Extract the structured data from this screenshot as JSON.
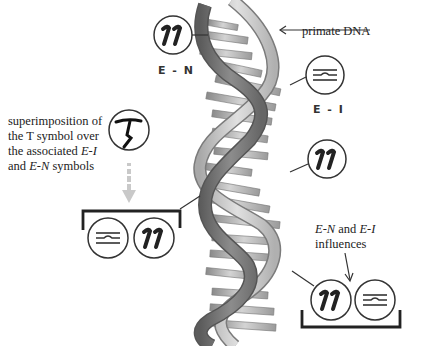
{
  "diagram": {
    "type": "annotated-illustration",
    "labels": {
      "primate_dna": "primate DNA",
      "en_label": "E - N",
      "ei_label": "E - I",
      "superimposition": {
        "line1": "superimposition of",
        "line2": "the T symbol over",
        "line3_pre": "the associated ",
        "line3_it": "E-I",
        "line4_pre": "and ",
        "line4_it": "E-N",
        "line4_post": " symbols"
      },
      "influences": {
        "line1_it_a": "E-N",
        "line1_mid": " and ",
        "line1_it_b": "E-I",
        "line2": "influences"
      }
    },
    "symbols": [
      {
        "id": "en-top",
        "glyph": "11",
        "meaning": "E-N"
      },
      {
        "id": "ei-right",
        "glyph": "lines-with-bump",
        "meaning": "E-I"
      },
      {
        "id": "en-mid",
        "glyph": "11",
        "meaning": "E-N"
      },
      {
        "id": "t-symbol",
        "glyph": "T",
        "meaning": "superimposed T"
      },
      {
        "id": "ei-group-left",
        "glyph": "lines-with-bump",
        "meaning": "E-I"
      },
      {
        "id": "en-group-left",
        "glyph": "11",
        "meaning": "E-N"
      },
      {
        "id": "en-group-right",
        "glyph": "11",
        "meaning": "E-N"
      },
      {
        "id": "ei-group-right",
        "glyph": "lines-with-bump",
        "meaning": "E-I"
      }
    ],
    "colors": {
      "helix_dark": "#6e6e6e",
      "helix_light": "#b9b9b9",
      "ink": "#222222",
      "arrow_gray": "#c8c8c8"
    }
  }
}
